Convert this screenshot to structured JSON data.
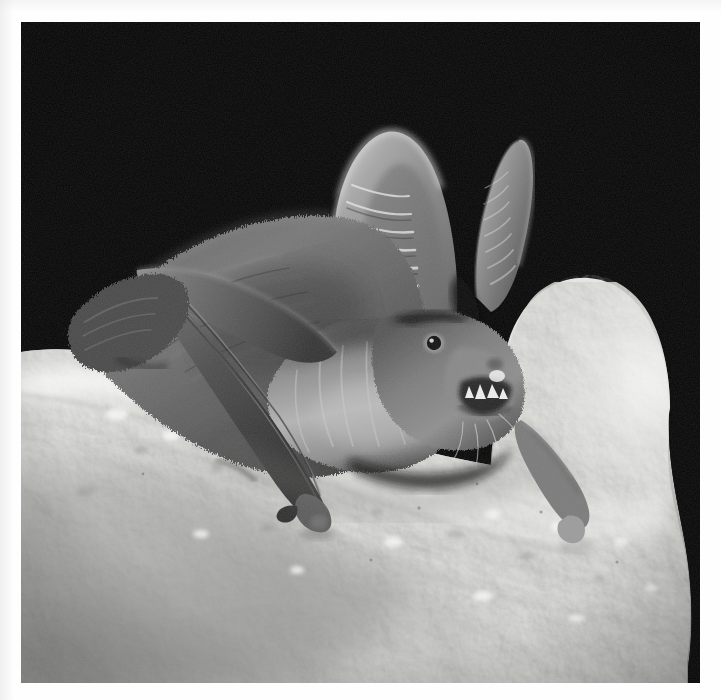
{
  "image": {
    "kind": "photograph",
    "medium": "black-and-white photograph",
    "subject": "bat",
    "common_name_guess": "long-eared bat",
    "scene": "A bat clinging to a pale, mottled limestone rock ledge at night, lit by flash against a completely black background.",
    "orientation": "square",
    "caption": "",
    "frame": {
      "mount_color": "#fefefe",
      "border_left_px": 21,
      "border_top_px": 22,
      "border_right_px": 21,
      "border_bottom_px": 17,
      "photo_width_px": 679,
      "photo_height_px": 661
    },
    "palette": {
      "background_black": "#050505",
      "deep_shadow": "#0c0c0c",
      "fur_dark": "#3a3a3a",
      "fur_mid": "#6e6e6e",
      "fur_light": "#a9a9a9",
      "ear_membrane": "#8f8f8f",
      "ear_highlight": "#d2d2d2",
      "wing_membrane": "#474747",
      "rock_bright": "#f4f4f2",
      "rock_mid": "#cfcfcd",
      "rock_shadow": "#9a9a98",
      "tooth_white": "#fafafa",
      "eye_black": "#101010"
    },
    "lighting": {
      "source": "direct flash from upper front",
      "background": "black, unlit",
      "highlight_direction": "top-left"
    },
    "subject_parts": [
      {
        "name": "left-ear-near",
        "label": "Near ear",
        "description": "Very large, upright, rounded-tip ear with a series of 8 horizontal transverse ridges on its inner face.",
        "ridge_count": 8
      },
      {
        "name": "right-ear-far",
        "label": "Far ear",
        "description": "Second large ear angled up and to the right, also transversely ridged, tip narrow and pointed."
      },
      {
        "name": "eye",
        "label": "Eye",
        "description": "Small round dark eye with a pale rim, set low beneath the ear base."
      },
      {
        "name": "muzzle",
        "label": "Muzzle and mouth",
        "description": "Mouth slightly open showing small white teeth; short bristly whiskers project forward."
      },
      {
        "name": "teeth",
        "label": "Teeth",
        "description": "Several small bright-white teeth visible in the partly open mouth."
      },
      {
        "name": "chest-fur",
        "label": "Chest fur",
        "description": "Pale silvery-grey fur on the throat and chest, darker grizzled fur over the shoulders and back."
      },
      {
        "name": "folded-wing",
        "label": "Folded wing",
        "description": "Long dark forearm and folded wing membrane running diagonally down and left across the rock."
      },
      {
        "name": "wing-thumb-claw",
        "label": "Wing thumb and claw",
        "description": "Hooked thumb claw planted against the rock at the lower end of the folded wing."
      },
      {
        "name": "right-forelimb",
        "label": "Right forelimb",
        "description": "Second limb reaching down to the right, tip resting on the bright rock."
      },
      {
        "name": "hind-foot",
        "label": "Hind foot and tail membrane",
        "description": "Dark textured foot and uropatagium at the upper-left of the body, gripping the rock edge."
      }
    ],
    "scene_parts": [
      {
        "name": "rock-ledge",
        "label": "Rock ledge",
        "description": "Pale, pitted, mottled limestone sloping from upper-left down to lower-right, brightly flash-lit, becoming grey and softer toward the bottom-left."
      },
      {
        "name": "rock-right-edge",
        "label": "Rock right edge",
        "description": "Irregular, scalloped right-hand silhouette of the rock against the black background."
      },
      {
        "name": "black-background",
        "label": "Black background",
        "description": "Featureless black night sky / cave void filling the upper portion of the frame."
      }
    ]
  }
}
